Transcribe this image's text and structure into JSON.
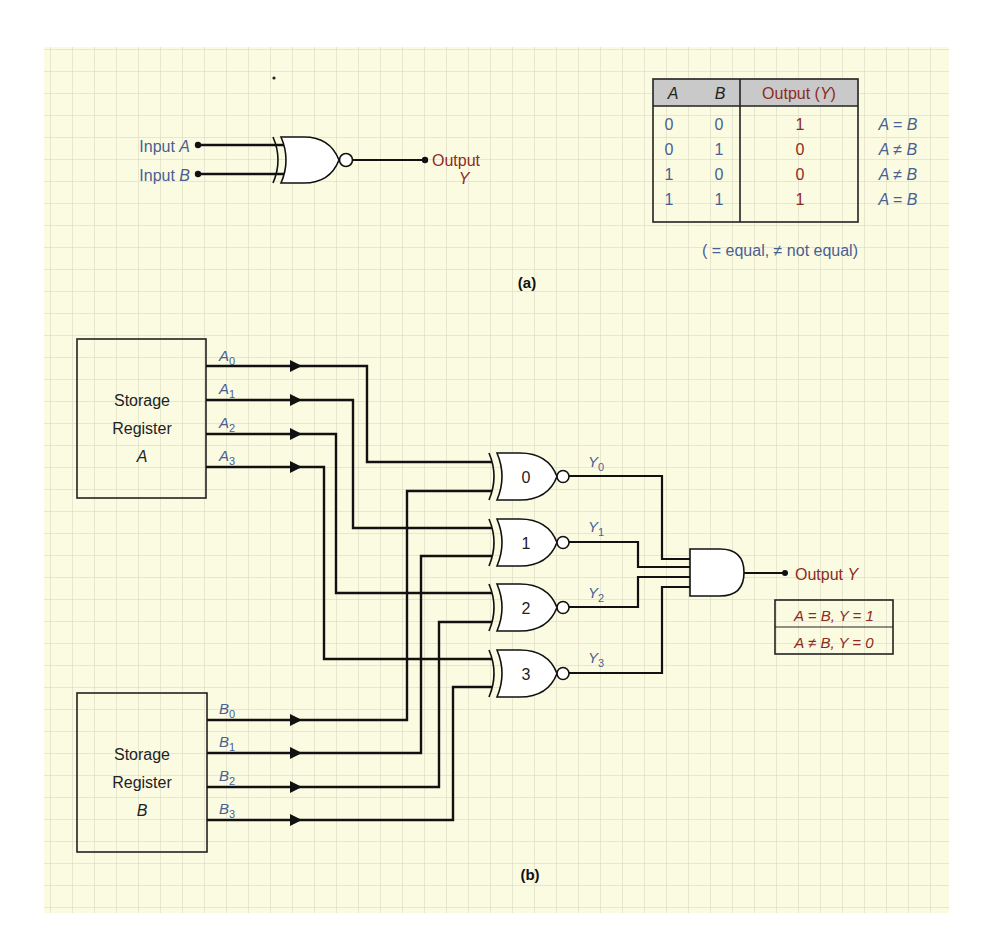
{
  "figure_a": {
    "label": "(a)",
    "input_a_label": "Input A",
    "input_a_prefix": "Input ",
    "input_a_var": "A",
    "input_b_prefix": "Input ",
    "input_b_var": "B",
    "output_label": "Output",
    "output_var": "Y",
    "gate_type": "XNOR",
    "truth_table": {
      "headers": [
        "A",
        "B",
        "Output (Y)"
      ],
      "header_a": "A",
      "header_b": "B",
      "header_out_prefix": "Output (",
      "header_out_var": "Y",
      "header_out_suffix": ")",
      "rows": [
        {
          "a": "0",
          "b": "0",
          "y": "1",
          "note_a": "A",
          "note_op": "=",
          "note_b": "B"
        },
        {
          "a": "0",
          "b": "1",
          "y": "0",
          "note_a": "A",
          "note_op": "≠",
          "note_b": "B"
        },
        {
          "a": "1",
          "b": "0",
          "y": "0",
          "note_a": "A",
          "note_op": "≠",
          "note_b": "B"
        },
        {
          "a": "1",
          "b": "1",
          "y": "1",
          "note_a": "A",
          "note_op": "=",
          "note_b": "B"
        }
      ],
      "legend": "( = equal, ≠ not equal)"
    }
  },
  "figure_b": {
    "label": "(b)",
    "register_a": {
      "line1": "Storage",
      "line2": "Register",
      "line3": "A"
    },
    "register_b": {
      "line1": "Storage",
      "line2": "Register",
      "line3": "B"
    },
    "a_bits": [
      {
        "var": "A",
        "sub": "0"
      },
      {
        "var": "A",
        "sub": "1"
      },
      {
        "var": "A",
        "sub": "2"
      },
      {
        "var": "A",
        "sub": "3"
      }
    ],
    "b_bits": [
      {
        "var": "B",
        "sub": "0"
      },
      {
        "var": "B",
        "sub": "1"
      },
      {
        "var": "B",
        "sub": "2"
      },
      {
        "var": "B",
        "sub": "3"
      }
    ],
    "gates": [
      "0",
      "1",
      "2",
      "3"
    ],
    "y_bits": [
      {
        "var": "Y",
        "sub": "0"
      },
      {
        "var": "Y",
        "sub": "1"
      },
      {
        "var": "Y",
        "sub": "2"
      },
      {
        "var": "Y",
        "sub": "3"
      }
    ],
    "output_prefix": "Output ",
    "output_var": "Y",
    "result_box": {
      "line1": "A = B, Y = 1",
      "line2": "A ≠ B, Y = 0"
    }
  },
  "colors": {
    "paper": "#fbfbe2",
    "grid": "#d3d3bd",
    "wire": "#111111",
    "blue_label": "#4a5f92",
    "red_label": "#8e2a22",
    "table_header": "#c9c9c9"
  }
}
